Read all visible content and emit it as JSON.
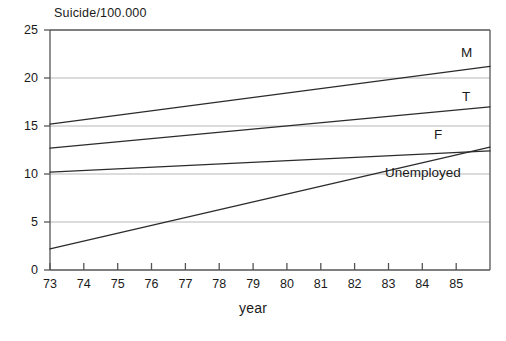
{
  "chart_data": {
    "type": "line",
    "title": "",
    "ylabel": "Suicide/100.000",
    "xlabel": "year",
    "xlim": [
      73,
      86
    ],
    "ylim": [
      0,
      25
    ],
    "xticks": [
      "73",
      "74",
      "75",
      "76",
      "77",
      "78",
      "79",
      "80",
      "81",
      "82",
      "83",
      "84",
      "85"
    ],
    "xtick_values": [
      73,
      74,
      75,
      76,
      77,
      78,
      79,
      80,
      81,
      82,
      83,
      84,
      85
    ],
    "yticks": [
      "0",
      "5",
      "10",
      "15",
      "20",
      "25"
    ],
    "ytick_values": [
      0,
      5,
      10,
      15,
      20,
      25
    ],
    "grid": "horizontal gridlines at 5, 10, 15, 20",
    "gridline_values": [
      5,
      10,
      15,
      20
    ],
    "legend_position": "inline labels at right end of each line",
    "x": [
      73,
      86
    ],
    "series": [
      {
        "name": "M",
        "label": "M",
        "values": [
          15.2,
          21.2
        ],
        "label_x": 86,
        "label_y": 23.1
      },
      {
        "name": "T",
        "label": "T",
        "values": [
          12.7,
          17.0
        ],
        "label_x": 86,
        "label_y": 18.9
      },
      {
        "name": "F",
        "label": "F",
        "values": [
          10.2,
          12.4
        ],
        "label_x": 85.4,
        "label_y": 14.2
      },
      {
        "name": "Unemployed",
        "label": "Unemployed",
        "values": [
          2.2,
          12.8
        ],
        "label_x": 83.2,
        "label_y": 11.2
      }
    ]
  },
  "colors": {
    "line": "#2b2b2b",
    "axis": "#4d4d4d",
    "grid": "#b4b4b4",
    "text": "#1a1a1a",
    "background": "#ffffff"
  },
  "axes": {
    "y_axis_title": "Suicide/100.000",
    "x_axis_title": "year"
  },
  "y_tick_labels": {
    "t0": "0",
    "t5": "5",
    "t10": "10",
    "t15": "15",
    "t20": "20",
    "t25": "25"
  },
  "x_tick_labels": {
    "t73": "73",
    "t74": "74",
    "t75": "75",
    "t76": "76",
    "t77": "77",
    "t78": "78",
    "t79": "79",
    "t80": "80",
    "t81": "81",
    "t82": "82",
    "t83": "83",
    "t84": "84",
    "t85": "85"
  },
  "series_labels": {
    "male": "M",
    "total": "T",
    "female": "F",
    "unemployed": "Unemployed"
  }
}
